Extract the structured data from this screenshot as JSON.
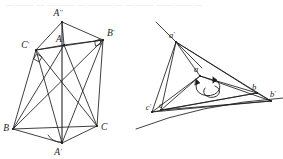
{
  "page": {
    "background_color": "#ffffff",
    "ink_color": "#1d1d1f",
    "width": 283,
    "height": 159
  },
  "header": {
    "clipped_text_line": "— —— — — —— — ——— — — —— —— —— —",
    "note": "partially cropped faint line of text at very top of the scan"
  },
  "figures": [
    {
      "id": "left-figure",
      "name": "triangle-pair-ABC-primes",
      "description": "Planar diagram: triangle ABC nested inside an outer hexagonal outline, with vertices A'', A', B', C' and many connecting chords. A right-angle square marker sits at C' and at B'; an arc angle marker sits at A'.",
      "points": [
        {
          "id": "App",
          "label": "A",
          "prime": "′′",
          "x": 62,
          "y": 22,
          "label_x": 58,
          "label_y": 16,
          "label_anchor": "middle"
        },
        {
          "id": "A",
          "label": "A",
          "prime": "",
          "x": 64,
          "y": 45,
          "label_x": 59,
          "label_y": 42,
          "label_anchor": "middle"
        },
        {
          "id": "Bp",
          "label": "B",
          "prime": "′",
          "x": 103,
          "y": 40,
          "label_x": 107,
          "label_y": 36,
          "label_anchor": "start"
        },
        {
          "id": "Cp",
          "label": "C",
          "prime": "′",
          "x": 36,
          "y": 50,
          "label_x": 29,
          "label_y": 48,
          "label_anchor": "end"
        },
        {
          "id": "B",
          "label": "B",
          "prime": "",
          "x": 13,
          "y": 129,
          "label_x": 9,
          "label_y": 131,
          "label_anchor": "end"
        },
        {
          "id": "C",
          "label": "C",
          "prime": "",
          "x": 97,
          "y": 126,
          "label_x": 101,
          "label_y": 130,
          "label_anchor": "start"
        },
        {
          "id": "Ap",
          "label": "A",
          "prime": "′",
          "x": 62,
          "y": 143,
          "label_x": 58,
          "label_y": 155,
          "label_anchor": "middle"
        }
      ],
      "segments": [
        [
          "App",
          "Cp"
        ],
        [
          "App",
          "Bp"
        ],
        [
          "App",
          "A"
        ],
        [
          "App",
          "Ap"
        ],
        [
          "A",
          "Bp"
        ],
        [
          "A",
          "Cp"
        ],
        [
          "A",
          "B"
        ],
        [
          "A",
          "C"
        ],
        [
          "A",
          "Ap"
        ],
        [
          "Cp",
          "B"
        ],
        [
          "Cp",
          "C"
        ],
        [
          "Cp",
          "Ap"
        ],
        [
          "Cp",
          "Bp"
        ],
        [
          "Bp",
          "C"
        ],
        [
          "Bp",
          "B"
        ],
        [
          "Bp",
          "Ap"
        ],
        [
          "B",
          "C"
        ],
        [
          "B",
          "Ap"
        ],
        [
          "C",
          "Ap"
        ]
      ],
      "markers": [
        {
          "type": "right-angle",
          "at": "Cp",
          "name": "right-angle-marker-c-prime"
        },
        {
          "type": "right-angle",
          "at": "Bp",
          "name": "right-angle-marker-b-prime"
        },
        {
          "type": "angle-arc",
          "at": "Ap",
          "name": "angle-arc-marker-a-prime"
        }
      ]
    },
    {
      "id": "right-figure",
      "name": "triangle-pair-abc-primes-projective",
      "description": "Projective diagram: triangle abc inscribed in triangle a'b'c' with a gently curved conic-like baseline running through c' and b'; rotation arcs with arrowheads are drawn near point a.",
      "points": [
        {
          "id": "ap",
          "label": "a",
          "prime": "′",
          "x": 176,
          "y": 42,
          "label_x": 172,
          "label_y": 38,
          "label_anchor": "middle"
        },
        {
          "id": "a",
          "label": "a",
          "prime": "",
          "x": 200,
          "y": 76,
          "label_x": 196,
          "label_y": 72,
          "label_anchor": "middle"
        },
        {
          "id": "b",
          "label": "b",
          "prime": "",
          "x": 257,
          "y": 93,
          "label_x": 254,
          "label_y": 90,
          "label_anchor": "middle"
        },
        {
          "id": "bp",
          "label": "b",
          "prime": "′",
          "x": 271,
          "y": 101,
          "label_x": 270,
          "label_y": 97,
          "label_anchor": "start"
        },
        {
          "id": "c",
          "label": "c",
          "prime": "",
          "x": 161,
          "y": 110,
          "label_x": 160,
          "label_y": 108,
          "label_anchor": "middle"
        },
        {
          "id": "cp",
          "label": "c",
          "prime": "′",
          "x": 152,
          "y": 112,
          "label_x": 149,
          "label_y": 110,
          "label_anchor": "end"
        }
      ],
      "segments": [
        [
          "ap",
          "cp"
        ],
        [
          "ap",
          "bp"
        ],
        [
          "ap",
          "b"
        ],
        [
          "ap",
          "a"
        ],
        [
          "ap",
          "c"
        ],
        [
          "a",
          "b"
        ],
        [
          "a",
          "bp"
        ],
        [
          "a",
          "c"
        ],
        [
          "a",
          "cp"
        ],
        [
          "c",
          "b"
        ],
        [
          "c",
          "bp"
        ],
        [
          "cp",
          "b"
        ],
        [
          "cp",
          "bp"
        ],
        [
          "b",
          "bp"
        ]
      ],
      "extended_lines": [
        {
          "name": "line-through-a-prime",
          "x1": 156,
          "y1": 22,
          "x2": 200,
          "y2": 66
        }
      ],
      "curve": {
        "name": "conic-baseline",
        "d": "M 136,129 Q 200,104 283,98"
      },
      "markers": [
        {
          "type": "rotation-arc",
          "at": "a",
          "name": "rotation-arc-outer"
        },
        {
          "type": "rotation-arc",
          "at": "a",
          "name": "rotation-arc-inner"
        }
      ]
    }
  ]
}
